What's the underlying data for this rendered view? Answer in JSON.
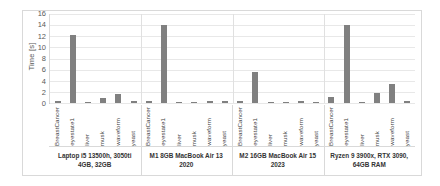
{
  "chart_data": {
    "type": "bar",
    "title": "",
    "xlabel": "",
    "ylabel": "Time [s]",
    "ylim": [
      0,
      16
    ],
    "ytick_step": 2,
    "yticks": [
      "16",
      "14",
      "12",
      "10",
      "8",
      "6",
      "4",
      "2",
      "0"
    ],
    "grid": true,
    "legend": "none",
    "bar_color": "#808080",
    "categories": [
      "BreastCancer",
      "eyestate1",
      "liver",
      "musk",
      "waveform",
      "yeast"
    ],
    "groups": [
      {
        "label": "Laptop i5 13500h, 3050ti 4GB, 32GB",
        "values": [
          0.4,
          12.1,
          0.1,
          0.9,
          1.6,
          0.3
        ]
      },
      {
        "label": "M1 8GB MacBook Air 13 2020",
        "values": [
          0.4,
          13.9,
          0.15,
          0.2,
          0.4,
          0.3
        ]
      },
      {
        "label": "M2 16GB MacBook Air 15 2023",
        "values": [
          0.3,
          5.5,
          0.1,
          0.1,
          0.3,
          0.2
        ]
      },
      {
        "label": "Ryzen 9 3900x, RTX 3090, 64GB RAM",
        "values": [
          1.0,
          13.9,
          0.2,
          1.8,
          3.3,
          0.4
        ]
      }
    ]
  }
}
